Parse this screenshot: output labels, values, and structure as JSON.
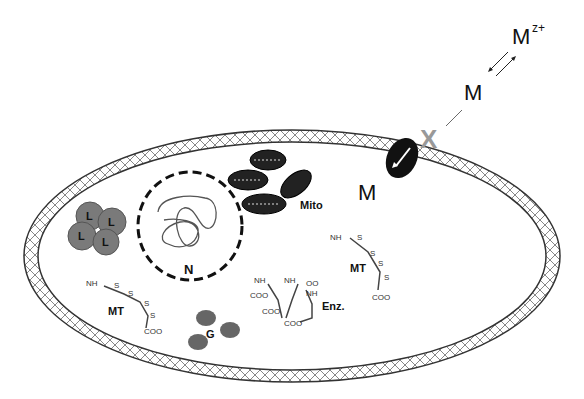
{
  "labels": {
    "ion_outside": "M",
    "ion_superscript": "z+",
    "metal_free": "M",
    "blocked": "X",
    "metal_inside": "M",
    "mitochondria": "Mito",
    "nucleus": "N",
    "lysosome": "L",
    "metallothionein_left": "MT",
    "metallothionein_right": "MT",
    "golgi": "G",
    "enzyme": "Enz."
  },
  "chem": {
    "nh3": "NH",
    "nh3_sub": "3",
    "nh3_sup": "−",
    "s": "S",
    "coo": "COO",
    "coo_sup": "−",
    "oo": "OO"
  },
  "colors": {
    "stroke": "#333333",
    "gray_fill": "#7a7a7a",
    "x_gray": "#999999",
    "dark": "#222222"
  }
}
